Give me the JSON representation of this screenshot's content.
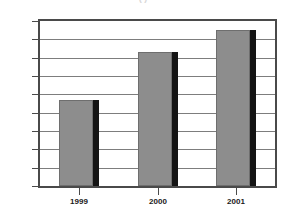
{
  "chart_data": {
    "type": "bar",
    "title": "",
    "xlabel": "",
    "ylabel": "",
    "categories": [
      "1999",
      "2000",
      "2001"
    ],
    "values": [
      97,
      123,
      135
    ],
    "series": [
      {
        "name": "",
        "values": [
          97,
          123,
          135
        ]
      }
    ],
    "ylim": [
      50,
      140
    ],
    "yticks": [
      50,
      60,
      70,
      80,
      90,
      100,
      110,
      120,
      130,
      140
    ],
    "ytick_labels": [
      "50",
      "60",
      "70",
      "80",
      "90",
      "100",
      "110",
      "120",
      "130",
      "140"
    ],
    "grid": "horizontal",
    "legend": "none",
    "bar_color": "#8d8d8d",
    "bar_shadow_color": "#141414",
    "axis_color": "#4a4a4a",
    "gridline_color": "#7d7d7d",
    "text_color": "#1a1a1a",
    "background": "#ffffff"
  },
  "figure": {
    "clipped_title": "(                    )"
  }
}
